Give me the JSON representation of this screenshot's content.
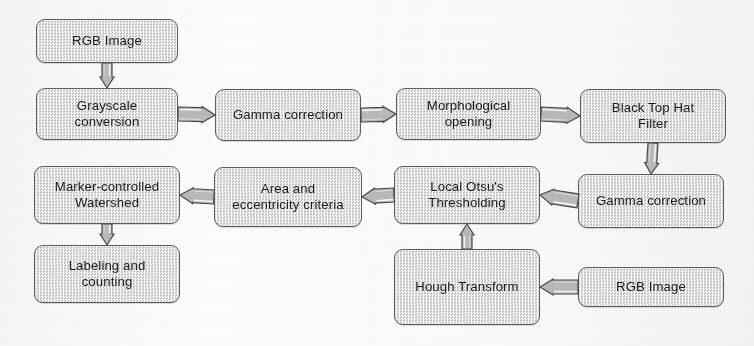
{
  "diagram": {
    "type": "flowchart",
    "orientation": "serpentine-horizontal",
    "colors": {
      "node_fill": "#d5d5d5",
      "node_border": "#5d5d5d",
      "arrow_fill": "#b9b9b9",
      "arrow_border": "#4a4a4a",
      "text": "#1b1b1b",
      "background": "#fdfdfc"
    },
    "nodes": [
      {
        "id": "rgb_image_top",
        "label": "RGB Image",
        "line1": "RGB Image",
        "line2": "",
        "x": 36,
        "y": 19,
        "w": 142,
        "h": 44
      },
      {
        "id": "grayscale",
        "label": "Grayscale conversion",
        "line1": "Grayscale",
        "line2": "conversion",
        "x": 36,
        "y": 88,
        "w": 142,
        "h": 52
      },
      {
        "id": "gamma_top",
        "label": "Gamma correction",
        "line1": "Gamma correction",
        "line2": "",
        "x": 215,
        "y": 89,
        "w": 146,
        "h": 52
      },
      {
        "id": "morphological",
        "label": "Morphological opening",
        "line1": "Morphological",
        "line2": "opening",
        "x": 396,
        "y": 88,
        "w": 145,
        "h": 52
      },
      {
        "id": "black_top_hat",
        "label": "Black Top Hat Filter",
        "line1": "Black Top Hat",
        "line2": "Filter",
        "x": 580,
        "y": 89,
        "w": 146,
        "h": 54
      },
      {
        "id": "gamma_second",
        "label": "Gamma correction",
        "line1": "Gamma correction",
        "line2": "",
        "x": 578,
        "y": 174,
        "w": 146,
        "h": 54
      },
      {
        "id": "local_otsu",
        "label": "Local Otsu's Thresholding",
        "line1": "Local Otsu's",
        "line2": "Thresholding",
        "x": 394,
        "y": 166,
        "w": 146,
        "h": 58
      },
      {
        "id": "area_eccentricity",
        "label": "Area and eccentricity criteria",
        "line1": "Area and",
        "line2": "eccentricity criteria",
        "x": 214,
        "y": 167,
        "w": 148,
        "h": 60
      },
      {
        "id": "marker_watershed",
        "label": "Marker-controlled Watershed",
        "line1": "Marker-controlled",
        "line2": "Watershed",
        "x": 34,
        "y": 166,
        "w": 146,
        "h": 58
      },
      {
        "id": "labeling_counting",
        "label": "Labeling and counting",
        "line1": "Labeling and",
        "line2": "counting",
        "x": 34,
        "y": 245,
        "w": 146,
        "h": 58
      },
      {
        "id": "hough_transform",
        "label": "Hough Transform",
        "line1": "Hough Transform",
        "line2": "",
        "x": 394,
        "y": 249,
        "w": 146,
        "h": 76
      },
      {
        "id": "rgb_image_bottom",
        "label": "RGB Image",
        "line1": "RGB Image",
        "line2": "",
        "x": 578,
        "y": 267,
        "w": 146,
        "h": 40
      }
    ],
    "edges": [
      {
        "id": "e1",
        "from": "rgb_image_top",
        "to": "grayscale",
        "direction": "down"
      },
      {
        "id": "e2",
        "from": "grayscale",
        "to": "gamma_top",
        "direction": "right"
      },
      {
        "id": "e3",
        "from": "gamma_top",
        "to": "morphological",
        "direction": "right"
      },
      {
        "id": "e4",
        "from": "morphological",
        "to": "black_top_hat",
        "direction": "right"
      },
      {
        "id": "e5",
        "from": "black_top_hat",
        "to": "gamma_second",
        "direction": "down"
      },
      {
        "id": "e6",
        "from": "gamma_second",
        "to": "local_otsu",
        "direction": "left"
      },
      {
        "id": "e7",
        "from": "local_otsu",
        "to": "area_eccentricity",
        "direction": "left"
      },
      {
        "id": "e8",
        "from": "area_eccentricity",
        "to": "marker_watershed",
        "direction": "left"
      },
      {
        "id": "e9",
        "from": "marker_watershed",
        "to": "labeling_counting",
        "direction": "down"
      },
      {
        "id": "e10",
        "from": "hough_transform",
        "to": "local_otsu",
        "direction": "up"
      },
      {
        "id": "e11",
        "from": "rgb_image_bottom",
        "to": "hough_transform",
        "direction": "left"
      }
    ]
  }
}
